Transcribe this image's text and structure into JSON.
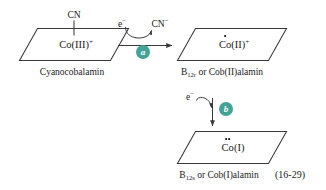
{
  "figure": {
    "equation_number": "(16-29)",
    "accent_color": "#42a396",
    "line_color": "#3a3a3a",
    "text_color": "#1a1a1a"
  },
  "species": {
    "cyanide_ligand": "CN",
    "cobalt_iii": "Co(III)",
    "cobalt_iii_charge": "+",
    "cobalt_ii": "Co(II)",
    "cobalt_ii_charge": "+",
    "cobalt_i": "Co(I)",
    "electron": "e",
    "electron_charge": "−",
    "cyanide_ion": "CN",
    "cyanide_ion_charge": "−"
  },
  "captions": {
    "cyanocobalamin": "Cyanocobalamin",
    "cob2_prefix": "B",
    "cob2_subscript": "12r",
    "cob2_suffix": " or Cob(II)alamin",
    "cob1_prefix": "B",
    "cob1_subscript": "12s",
    "cob1_suffix": " or Cob(I)alamin"
  },
  "steps": {
    "step_a": "a",
    "step_b": "b"
  }
}
